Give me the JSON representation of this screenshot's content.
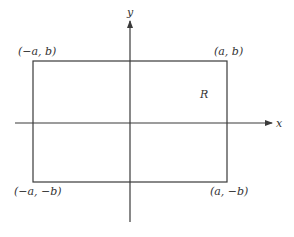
{
  "diagram": {
    "axes": {
      "x_label": "x",
      "y_label": "y"
    },
    "region_label": "R",
    "corners": {
      "top_left": "(−a, b)",
      "top_right": "(a, b)",
      "bottom_left": "(−a, −b)",
      "bottom_right": "(a, −b)"
    },
    "colors": {
      "line": "#3a3a3a",
      "text": "#333333",
      "background": "#ffffff"
    }
  }
}
